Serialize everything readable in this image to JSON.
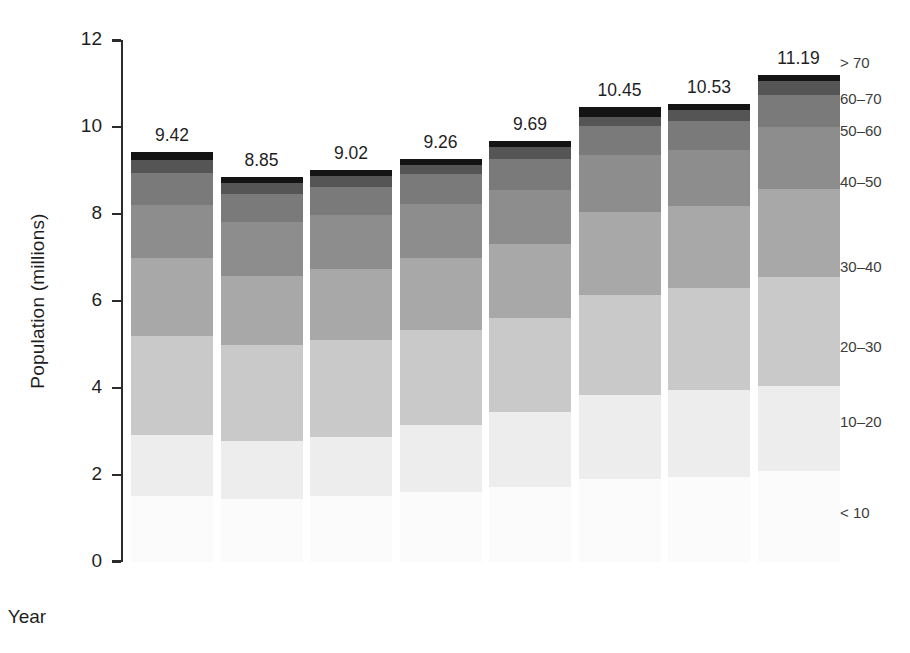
{
  "chart_data": {
    "type": "bar",
    "title": "",
    "subtitle": "",
    "xlabel": "Year",
    "ylabel": "Population (millions)",
    "categories": [
      "2003",
      "2004",
      "2005",
      "2006",
      "2007",
      "2008",
      "2009",
      "2010"
    ],
    "ylim": [
      0,
      12
    ],
    "yticks": [
      0,
      2,
      4,
      6,
      8,
      10,
      12
    ],
    "ytick_labels": [
      "0",
      "2",
      "4",
      "6",
      "8",
      "10",
      "12"
    ],
    "grid": false,
    "stacked": true,
    "legend_position": "right",
    "bar_totals": [
      "9.42",
      "8.85",
      "9.02",
      "9.26",
      "9.69",
      "10.45",
      "10.53",
      "11.19"
    ],
    "bar_total_values": [
      9.42,
      8.85,
      9.02,
      9.26,
      9.69,
      10.45,
      10.53,
      11.19
    ],
    "series": [
      {
        "name": "< 10",
        "color": "#fbfbfb",
        "values": [
          1.52,
          1.45,
          1.52,
          1.6,
          1.72,
          1.9,
          1.95,
          2.1
        ]
      },
      {
        "name": "10-20",
        "color": "#ededed",
        "values": [
          1.4,
          1.32,
          1.36,
          1.55,
          1.73,
          1.93,
          2.0,
          1.95
        ]
      },
      {
        "name": "20-30",
        "color": "#c9c9c9",
        "values": [
          2.28,
          2.21,
          2.22,
          2.19,
          2.16,
          2.3,
          2.35,
          2.5
        ]
      },
      {
        "name": "30-40",
        "color": "#a8a8a8",
        "values": [
          1.78,
          1.6,
          1.63,
          1.65,
          1.7,
          1.92,
          1.88,
          2.02
        ]
      },
      {
        "name": "40-50",
        "color": "#8d8d8d",
        "values": [
          1.23,
          1.23,
          1.25,
          1.24,
          1.25,
          1.3,
          1.3,
          1.44
        ]
      },
      {
        "name": "50-60",
        "color": "#7a7a7a",
        "values": [
          0.73,
          0.64,
          0.64,
          0.68,
          0.7,
          0.67,
          0.66,
          0.72
        ]
      },
      {
        "name": "60-70",
        "color": "#555555",
        "values": [
          0.3,
          0.26,
          0.26,
          0.22,
          0.28,
          0.22,
          0.25,
          0.32
        ]
      },
      {
        "name": "> 70",
        "color": "#141414",
        "values": [
          0.18,
          0.14,
          0.14,
          0.13,
          0.15,
          0.21,
          0.14,
          0.14
        ]
      }
    ],
    "legend_entries": [
      {
        "label": "> 70",
        "top": 54,
        "color": "#141414"
      },
      {
        "label": "60-70",
        "top": 90,
        "color": "#555555"
      },
      {
        "label": "50-60",
        "top": 122,
        "color": "#7a7a7a"
      },
      {
        "label": "40-50",
        "top": 173,
        "color": "#8d8d8d"
      },
      {
        "label": "30-40",
        "top": 258,
        "color": "#a8a8a8"
      },
      {
        "label": "20-30",
        "top": 338,
        "color": "#c9c9c9"
      },
      {
        "label": "10-20",
        "top": 413,
        "color": "#ededed"
      },
      {
        "label": "< 10",
        "top": 504,
        "color": "#fbfbfb"
      }
    ]
  }
}
